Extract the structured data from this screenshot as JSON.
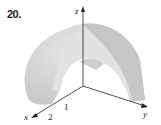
{
  "problem": {
    "number": "20."
  },
  "axes": {
    "x": {
      "label": "x"
    },
    "y": {
      "label": "y"
    },
    "z": {
      "label": "z"
    }
  },
  "ticks": {
    "inner": "1",
    "outer": "2"
  },
  "colors": {
    "outer_surface": "#d2d2d2",
    "inner_surface": "#e6e6e6",
    "cut_face": "#c4c4c4",
    "axis": "#222222"
  }
}
